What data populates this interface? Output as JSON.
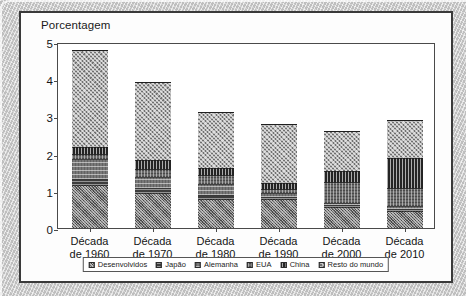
{
  "figure": {
    "title": "Porcentagem"
  },
  "axes": {
    "y_ticks": [
      "0",
      "1",
      "2",
      "3",
      "4",
      "5"
    ],
    "x_labels": [
      {
        "line1": "Década",
        "line2": "de 1960"
      },
      {
        "line1": "Década",
        "line2": "de 1970"
      },
      {
        "line1": "Década",
        "line2": "de 1980"
      },
      {
        "line1": "Década",
        "line2": "de 1990"
      },
      {
        "line1": "Década",
        "line2": "de 2000"
      },
      {
        "line1": "Década",
        "line2": "de 2010"
      }
    ]
  },
  "legend": {
    "items": [
      {
        "label": "Desenvolvidos",
        "pattern": "pat-desenvolvidos"
      },
      {
        "label": "Japão",
        "pattern": "pat-japao"
      },
      {
        "label": "Alemanha",
        "pattern": "pat-alemanha"
      },
      {
        "label": "EUA",
        "pattern": "pat-eua"
      },
      {
        "label": "China",
        "pattern": "pat-china"
      },
      {
        "label": "Resto do mundo",
        "pattern": "pat-resto"
      }
    ]
  },
  "chart_data": {
    "type": "bar",
    "subtype": "stacked",
    "title": "Porcentagem",
    "xlabel": "",
    "ylabel": "Porcentagem",
    "ylim": [
      0,
      5
    ],
    "ytick_step": 1,
    "grid": false,
    "legend_position": "bottom",
    "categories": [
      "Década de 1960",
      "Década de 1970",
      "Década de 1980",
      "Década de 1990",
      "Década de 2000",
      "Década de 2010"
    ],
    "series": [
      {
        "name": "Desenvolvidos",
        "values": [
          1.15,
          0.95,
          0.78,
          0.78,
          0.57,
          0.45
        ]
      },
      {
        "name": "Japão",
        "values": [
          0.18,
          0.12,
          0.1,
          0.05,
          0.04,
          0.05
        ]
      },
      {
        "name": "Alemanha",
        "values": [
          0.52,
          0.3,
          0.3,
          0.12,
          0.05,
          0.1
        ]
      },
      {
        "name": "EUA",
        "values": [
          0.15,
          0.22,
          0.25,
          0.1,
          0.58,
          0.48
        ]
      },
      {
        "name": "China",
        "values": [
          0.17,
          0.25,
          0.19,
          0.17,
          0.3,
          0.81
        ]
      },
      {
        "name": "Resto do mundo",
        "values": [
          2.61,
          2.08,
          1.5,
          1.57,
          1.07,
          1.01
        ]
      }
    ],
    "totals": [
      4.78,
      3.92,
      3.12,
      2.79,
      2.61,
      2.9
    ]
  }
}
